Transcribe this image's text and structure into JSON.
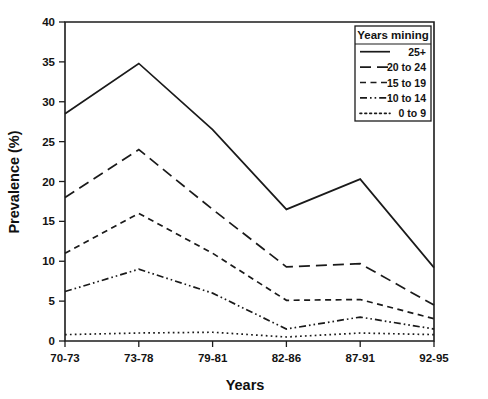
{
  "chart_data": {
    "type": "line",
    "title": "",
    "xlabel": "Years",
    "ylabel": "Prevalence (%)",
    "categories": [
      "70-73",
      "73-78",
      "79-81",
      "82-86",
      "87-91",
      "92-95"
    ],
    "ylim": [
      0,
      40
    ],
    "yticks": [
      0,
      5,
      10,
      15,
      20,
      25,
      30,
      35,
      40
    ],
    "grid": false,
    "legend_position": "top-right",
    "legend_title": "Years mining",
    "series": [
      {
        "name": "25+",
        "line_style": "solid",
        "values": [
          28.5,
          34.8,
          26.5,
          16.5,
          20.3,
          9.2
        ]
      },
      {
        "name": "20 to 24",
        "line_style": "long-dash",
        "values": [
          18.0,
          24.0,
          16.5,
          9.3,
          9.7,
          4.5
        ]
      },
      {
        "name": "15 to 19",
        "line_style": "short-dash",
        "values": [
          11.0,
          16.0,
          11.0,
          5.1,
          5.2,
          2.8
        ]
      },
      {
        "name": "10 to 14",
        "line_style": "dash-dot-dot",
        "values": [
          6.2,
          9.0,
          6.0,
          1.5,
          3.0,
          1.5
        ]
      },
      {
        "name": "0 to 9",
        "line_style": "dotted",
        "values": [
          0.8,
          1.0,
          1.1,
          0.5,
          1.0,
          0.8
        ]
      }
    ]
  },
  "axis": {
    "y_tick_labels": [
      "0",
      "5",
      "10",
      "15",
      "20",
      "25",
      "30",
      "35",
      "40"
    ],
    "x_tick_labels": [
      "70-73",
      "73-78",
      "79-81",
      "82-86",
      "87-91",
      "92-95"
    ],
    "y_title": "Prevalence (%)",
    "x_title": "Years"
  },
  "legend": {
    "title": "Years mining",
    "entries": [
      {
        "label": "25+"
      },
      {
        "label": "20 to 24"
      },
      {
        "label": "15 to 19"
      },
      {
        "label": "10 to 14"
      },
      {
        "label": "0 to 9"
      }
    ]
  },
  "style": {
    "ink": "#1a1a1a",
    "background": "#ffffff"
  }
}
